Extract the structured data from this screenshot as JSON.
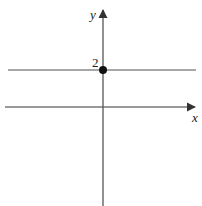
{
  "diagram": {
    "type": "coordinate-plane",
    "axes": {
      "x_label": "x",
      "y_label": "y",
      "axis_color": "#555555"
    },
    "line": {
      "equation": "y = 2",
      "color": "#888888"
    },
    "point": {
      "label": "2",
      "coords": "(0, 2)",
      "color": "#111111"
    }
  }
}
